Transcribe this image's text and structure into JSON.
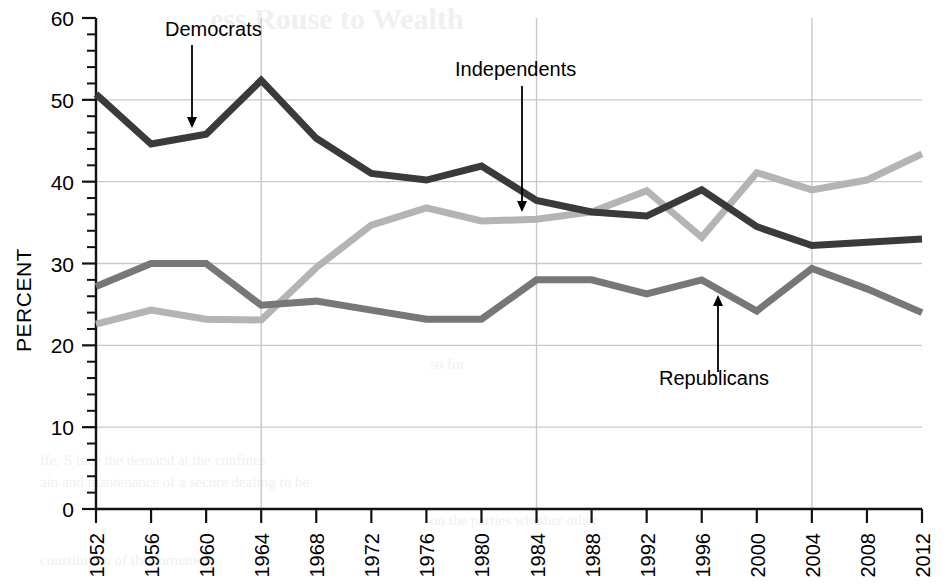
{
  "chart_data": {
    "type": "line",
    "title": "",
    "xlabel": "",
    "ylabel": "PERCENT",
    "xlim": [
      1952,
      2012
    ],
    "ylim": [
      0,
      60
    ],
    "ytick_step": 10,
    "yminor_step": 2,
    "xtick_step": 4,
    "grid": true,
    "gridlines_y": [
      10,
      20,
      30,
      40,
      50
    ],
    "gridlines_x": [
      1964,
      1984,
      2004
    ],
    "legend_position": "annotations-inline",
    "x": [
      1952,
      1956,
      1960,
      1964,
      1968,
      1972,
      1976,
      1980,
      1984,
      1988,
      1992,
      1996,
      2000,
      2004,
      2008,
      2012
    ],
    "xtick_labels": [
      "1952",
      "1956",
      "1960",
      "1964",
      "1968",
      "1972",
      "1976",
      "1980",
      "1984",
      "1988",
      "1992",
      "1996",
      "2000",
      "2004",
      "2008",
      "2012"
    ],
    "ytick_labels": [
      "0",
      "10",
      "20",
      "30",
      "40",
      "50",
      "60"
    ],
    "series": [
      {
        "name": "Democrats",
        "color": "#3a3a3a",
        "values": [
          50.7,
          44.6,
          45.8,
          52.4,
          45.3,
          41.0,
          40.2,
          41.9,
          37.7,
          36.3,
          35.8,
          39.0,
          34.5,
          32.2,
          32.6,
          33.0
        ]
      },
      {
        "name": "Independents",
        "color": "#b4b4b4",
        "values": [
          22.6,
          24.3,
          23.2,
          23.1,
          29.5,
          34.7,
          36.8,
          35.2,
          35.4,
          36.3,
          38.9,
          33.2,
          41.1,
          39.0,
          40.2,
          43.4
        ]
      },
      {
        "name": "Republicans",
        "color": "#777777",
        "values": [
          27.2,
          30.0,
          30.0,
          24.9,
          25.4,
          24.3,
          23.2,
          23.2,
          28.0,
          28.0,
          26.3,
          28.0,
          24.2,
          29.4,
          26.9,
          24.0
        ]
      }
    ],
    "annotations": [
      {
        "label": "Democrats",
        "label_x": 165,
        "label_y": 36,
        "arrow_from_x": 192,
        "arrow_from_y": 45,
        "arrow_to_x": 192,
        "arrow_to_y": 128,
        "target_series": "Democrats",
        "target_year": 1958
      },
      {
        "label": "Independents",
        "label_x": 455,
        "label_y": 76,
        "arrow_from_x": 522,
        "arrow_from_y": 86,
        "arrow_to_x": 522,
        "arrow_to_y": 212,
        "target_series": "Independents",
        "target_year": 1984
      },
      {
        "label": "Republicans",
        "label_x": 659,
        "label_y": 385,
        "arrow_from_x": 718,
        "arrow_from_y": 372,
        "arrow_to_x": 718,
        "arrow_to_y": 295,
        "target_series": "Republicans",
        "target_year": 1997
      }
    ]
  },
  "geometry": {
    "plot_left": 96,
    "plot_right": 922,
    "plot_top": 18,
    "plot_bottom": 509
  },
  "background_ghost": [
    {
      "text": "ess Rouse to Wealth",
      "x": 210,
      "y": 2,
      "size": 30,
      "weight": "bold"
    },
    {
      "text": "so for",
      "x": 430,
      "y": 356,
      "size": 15,
      "weight": "normal"
    },
    {
      "text": "ffe, S  ince  the  demand at the  confines",
      "x": 40,
      "y": 452,
      "size": 15,
      "weight": "normal"
    },
    {
      "text": "ain and mantenance of a secure dealing to be",
      "x": 40,
      "y": 474,
      "size": 15,
      "weight": "normal"
    },
    {
      "text": "on the parties whether other",
      "x": 430,
      "y": 512,
      "size": 15,
      "weight": "normal"
    },
    {
      "text": "constitution of the formation",
      "x": 40,
      "y": 552,
      "size": 15,
      "weight": "normal"
    }
  ]
}
